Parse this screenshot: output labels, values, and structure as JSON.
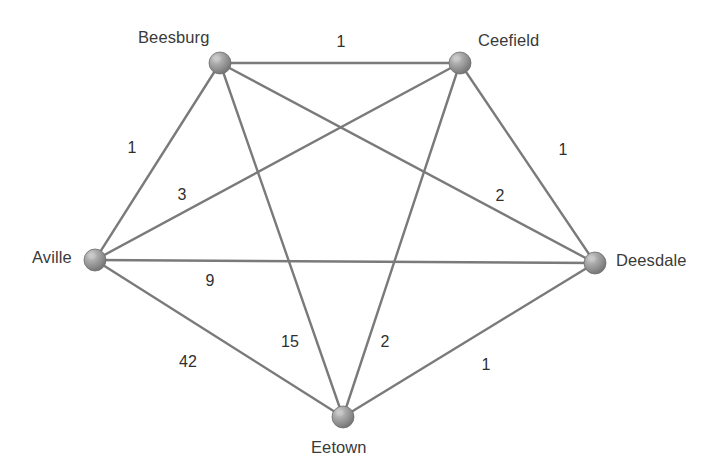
{
  "diagram": {
    "type": "weighted-complete-graph",
    "node_color": "#8f8f8f",
    "node_highlight_color": "#c9c9c9",
    "edge_color": "#7a7a7a",
    "label_color": "#3a3a3a",
    "background_color": "#ffffff"
  },
  "nodes": [
    {
      "id": "beesburg",
      "label": "Beesburg",
      "x": 220,
      "y": 63,
      "r": 11,
      "label_x": 138,
      "label_y": 28
    },
    {
      "id": "ceefield",
      "label": "Ceefield",
      "x": 460,
      "y": 63,
      "r": 11,
      "label_x": 478,
      "label_y": 31
    },
    {
      "id": "aville",
      "label": "Aville",
      "x": 95,
      "y": 260,
      "r": 11,
      "label_x": 32,
      "label_y": 248
    },
    {
      "id": "deesdale",
      "label": "Deesdale",
      "x": 595,
      "y": 263,
      "r": 11,
      "label_x": 616,
      "label_y": 251
    },
    {
      "id": "eetown",
      "label": "Eetown",
      "x": 343,
      "y": 417,
      "r": 11,
      "label_x": 311,
      "label_y": 438
    }
  ],
  "edges": [
    {
      "id": "beesburg-ceefield",
      "from": "beesburg",
      "to": "ceefield",
      "weight": "1",
      "label_x": 341,
      "label_y": 42
    },
    {
      "id": "aville-beesburg",
      "from": "aville",
      "to": "beesburg",
      "weight": "1",
      "label_x": 132,
      "label_y": 148
    },
    {
      "id": "ceefield-deesdale",
      "from": "ceefield",
      "to": "deesdale",
      "weight": "1",
      "label_x": 563,
      "label_y": 150
    },
    {
      "id": "aville-ceefield",
      "from": "aville",
      "to": "ceefield",
      "weight": "3",
      "label_x": 182,
      "label_y": 195
    },
    {
      "id": "beesburg-deesdale",
      "from": "beesburg",
      "to": "deesdale",
      "weight": "2",
      "label_x": 500,
      "label_y": 196
    },
    {
      "id": "aville-deesdale",
      "from": "aville",
      "to": "deesdale",
      "weight": "9",
      "label_x": 210,
      "label_y": 281
    },
    {
      "id": "beesburg-eetown",
      "from": "beesburg",
      "to": "eetown",
      "weight": "15",
      "label_x": 290,
      "label_y": 342
    },
    {
      "id": "ceefield-eetown",
      "from": "ceefield",
      "to": "eetown",
      "weight": "2",
      "label_x": 385,
      "label_y": 342
    },
    {
      "id": "aville-eetown",
      "from": "aville",
      "to": "eetown",
      "weight": "42",
      "label_x": 188,
      "label_y": 362
    },
    {
      "id": "deesdale-eetown",
      "from": "deesdale",
      "to": "eetown",
      "weight": "1",
      "label_x": 486,
      "label_y": 365
    }
  ]
}
